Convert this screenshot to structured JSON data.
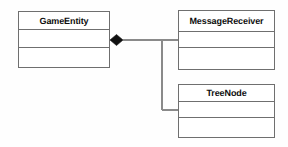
{
  "diagram": {
    "type": "uml-class-diagram",
    "canvas": {
      "width": 288,
      "height": 147,
      "background": "#fefefe"
    },
    "style": {
      "border_color": "#6f6f6f",
      "line_color": "#8a8a8a",
      "text_color": "#0d0d0d",
      "diamond_fill": "#101010"
    },
    "classes": [
      {
        "id": "gameentity",
        "name": "GameEntity",
        "compartments": [
          "attributes",
          "operations"
        ],
        "attributes": [],
        "operations": []
      },
      {
        "id": "messagereceiver",
        "name": "MessageReceiver",
        "compartments": [
          "attributes",
          "operations"
        ],
        "attributes": [],
        "operations": []
      },
      {
        "id": "treenode",
        "name": "TreeNode",
        "compartments": [
          "attributes",
          "operations"
        ],
        "attributes": [],
        "operations": []
      }
    ],
    "relationships": [
      {
        "id": "gameentity-messagereceiver",
        "type": "composition",
        "source": "GameEntity",
        "target": "MessageReceiver",
        "source_decoration": "filled-diamond",
        "target_decoration": "none",
        "source_label": "",
        "target_label": "",
        "routing": "orthogonal"
      },
      {
        "id": "gameentity-treenode",
        "type": "composition",
        "source": "GameEntity",
        "target": "TreeNode",
        "source_decoration": "filled-diamond",
        "target_decoration": "none",
        "source_label": "",
        "target_label": "",
        "routing": "orthogonal"
      }
    ]
  }
}
